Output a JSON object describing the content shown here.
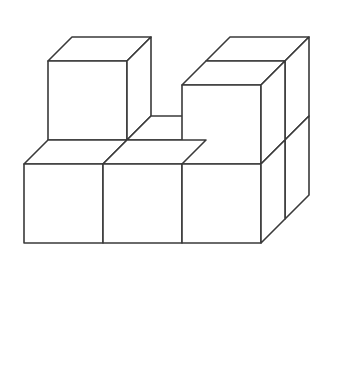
{
  "figure": {
    "background_color": "#ffffff",
    "line_color": "#3a3a3a",
    "line_width": 1.6,
    "canvas": {
      "width": 357,
      "height": 374
    },
    "projection": {
      "type": "isometric",
      "origin": {
        "x": 24,
        "y": 243
      },
      "unit_x": {
        "dx": 79,
        "dy": 0
      },
      "unit_y": {
        "dx": 24,
        "dy": -24
      },
      "unit_z": {
        "dx": 0,
        "dy": -79
      }
    },
    "cube_count": 9,
    "cubes": [
      {
        "name": "back-left-lower",
        "x": 0,
        "y": 1,
        "z": 0
      },
      {
        "name": "back-left-upper",
        "x": 0,
        "y": 1,
        "z": 1
      },
      {
        "name": "back-middle-lower",
        "x": 1,
        "y": 1,
        "z": 0
      },
      {
        "name": "back-right-lower",
        "x": 2,
        "y": 1,
        "z": 0
      },
      {
        "name": "back-right-upper",
        "x": 2,
        "y": 1,
        "z": 1
      },
      {
        "name": "front-left-lower",
        "x": 0,
        "y": 0,
        "z": 0
      },
      {
        "name": "front-middle-lower",
        "x": 1,
        "y": 0,
        "z": 0
      },
      {
        "name": "front-right-lower",
        "x": 2,
        "y": 0,
        "z": 0
      },
      {
        "name": "front-right-upper",
        "x": 2,
        "y": 0,
        "z": 1
      }
    ]
  }
}
